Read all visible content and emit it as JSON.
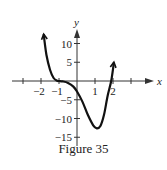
{
  "caption": "Figure 35",
  "chart_data": {
    "type": "line",
    "title": "Figure 35",
    "xlabel": "x",
    "ylabel": "y",
    "x_ticks": [
      -3,
      -2,
      -1,
      0,
      1,
      2,
      3
    ],
    "x_tick_labels": [
      "-2",
      "-1",
      "1",
      "2"
    ],
    "y_ticks": [
      -15,
      -10,
      -5,
      5,
      10
    ],
    "y_tick_labels": [
      "-15",
      "-10",
      "-5",
      "5",
      "10"
    ],
    "xlim": [
      -3.2,
      3.5
    ],
    "ylim": [
      -16,
      17
    ],
    "grid": false,
    "series": [
      {
        "name": "f(x)",
        "x": [
          -1.85,
          -1.7,
          -1.5,
          -1.3,
          -1.1,
          -1.0,
          -0.8,
          -0.5,
          -0.2,
          0.0,
          0.3,
          0.6,
          0.9,
          1.1,
          1.3,
          1.5,
          1.7,
          1.9,
          2.05
        ],
        "y": [
          12.5,
          7.0,
          3.0,
          0.8,
          0.05,
          0.0,
          -0.1,
          -0.5,
          -1.5,
          -2.8,
          -5.5,
          -9.0,
          -11.8,
          -12.6,
          -12.0,
          -9.0,
          -4.0,
          0.0,
          5.0
        ]
      }
    ]
  },
  "plot": {
    "origin_px": [
      77,
      81
    ],
    "x_unit_px": 18,
    "y_unit_px": 3.75,
    "curve_color": "#111111",
    "axis_color": "#333333"
  }
}
